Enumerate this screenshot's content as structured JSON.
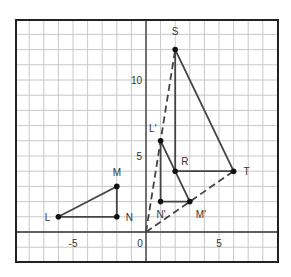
{
  "diagram": {
    "type": "coordinate-plane-dilation",
    "axes": {
      "x_ticks": [
        {
          "value": -5,
          "label": "-5"
        },
        {
          "value": 0,
          "label": "0"
        },
        {
          "value": 5,
          "label": "5"
        }
      ],
      "y_ticks": [
        {
          "value": 5,
          "label": "5"
        },
        {
          "value": 10,
          "label": "10"
        }
      ],
      "x_range": [
        -9,
        9
      ],
      "y_range": [
        -2,
        14
      ],
      "grid": true
    },
    "points": [
      {
        "name": "S",
        "label": "S",
        "x": 2,
        "y": 12
      },
      {
        "name": "R",
        "label": "R",
        "x": 2,
        "y": 4
      },
      {
        "name": "T",
        "label": "T",
        "x": 6,
        "y": 4
      },
      {
        "name": "L-prime",
        "label": "L'",
        "x": 1,
        "y": 6
      },
      {
        "name": "N-prime",
        "label": "N'",
        "x": 1,
        "y": 2
      },
      {
        "name": "M-prime",
        "label": "M'",
        "x": 3,
        "y": 2
      },
      {
        "name": "L",
        "label": "L",
        "x": -6,
        "y": 1
      },
      {
        "name": "M",
        "label": "M",
        "x": -2,
        "y": 3
      },
      {
        "name": "N",
        "label": "N",
        "x": -2,
        "y": 1
      }
    ],
    "triangles": [
      {
        "name": "triangle-SRT",
        "vertices": [
          "S",
          "R",
          "T"
        ]
      },
      {
        "name": "triangle-LprimeNprimeMprime",
        "vertices": [
          "L'",
          "N'",
          "M'"
        ]
      },
      {
        "name": "triangle-LMN",
        "vertices": [
          "L",
          "M",
          "N"
        ]
      }
    ],
    "dashed_rays": [
      {
        "name": "ray-origin-to-S",
        "from": [
          0,
          0
        ],
        "to": [
          2,
          12
        ]
      },
      {
        "name": "ray-origin-to-T",
        "from": [
          0,
          0
        ],
        "to": [
          6,
          4
        ]
      }
    ],
    "colors": {
      "line": "#444444",
      "grid": "#c8c8c8",
      "frame": "#222222",
      "point": "#111111"
    }
  }
}
